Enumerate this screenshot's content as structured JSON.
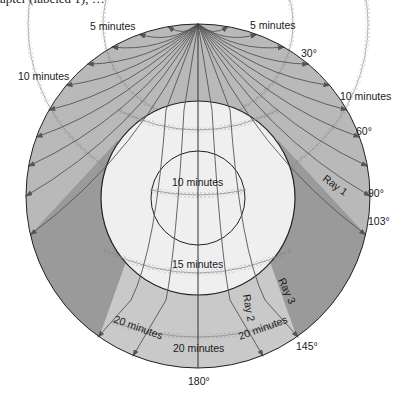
{
  "caption_fragment": "apter (labeled 1), …",
  "colors": {
    "mantle": "#b9b9b9",
    "shadow_zone": "#9a9a9a",
    "core_band": "#c9c9c9",
    "outer_core": "#efefef",
    "inner_core": "#f4f4f4",
    "ray": "#555555",
    "outline": "#222222"
  },
  "labels": {
    "five_min_left": "5 minutes",
    "five_min_right": "5 minutes",
    "ten_min_left": "10 minutes",
    "ten_min_right": "10 minutes",
    "deg_30": "30°",
    "deg_60": "60°",
    "deg_90": "90°",
    "deg_103": "103°",
    "deg_145": "145°",
    "deg_180": "180°",
    "ray_1": "Ray 1",
    "ray_2": "Ray 2",
    "ray_3": "Ray 3",
    "ten_min_core": "10 minutes",
    "fifteen_min": "15 minutes",
    "twenty_min_left": "20 minutes",
    "twenty_min_center": "20 minutes",
    "twenty_min_right": "20 minutes"
  },
  "angles": {
    "mantle_ray_exits_deg": [
      10,
      20,
      30,
      40,
      50,
      60,
      70,
      80,
      90,
      103
    ],
    "shadow_zone_start_deg": 103,
    "shadow_zone_end_deg": 145,
    "core_ray_exits_deg": [
      145,
      165,
      180
    ]
  }
}
